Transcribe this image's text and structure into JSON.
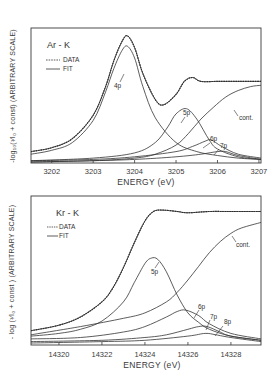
{
  "chart_data": [
    {
      "type": "line",
      "title": "Ar - K",
      "xlabel": "ENERGY (eV)",
      "ylabel": "-log10(I/I0 + const) (ARBITRARY SCALE)",
      "ylabel_text": "-log₁₀(¹⁄I₀ + const) (ARBITRARY SCALE)",
      "xlim": [
        3201.5,
        3207.05
      ],
      "xticks": [
        3202,
        3203,
        3204,
        3205,
        3206,
        3207
      ],
      "xtick_labels": [
        "3202",
        "3203",
        "3204",
        "3205",
        "3206",
        "3207"
      ],
      "grid": false,
      "legend": {
        "position": "upper left",
        "entries": [
          {
            "label": "DATA",
            "style": "dashed"
          },
          {
            "label": "FIT",
            "style": "solid"
          }
        ]
      },
      "annotations": [
        "4p",
        "5p",
        "6p",
        "7p",
        "cont."
      ],
      "series": [
        {
          "name": "DATA",
          "x": [
            3201.5,
            3202,
            3202.5,
            3203,
            3203.3,
            3203.5,
            3203.7,
            3203.83,
            3204,
            3204.2,
            3204.5,
            3204.7,
            3205,
            3205.2,
            3205.4,
            3205.6,
            3206,
            3206.5,
            3207.05
          ],
          "y": [
            0.08,
            0.11,
            0.18,
            0.36,
            0.58,
            0.78,
            0.93,
            0.97,
            0.88,
            0.68,
            0.48,
            0.44,
            0.52,
            0.62,
            0.65,
            0.62,
            0.62,
            0.62,
            0.62
          ]
        },
        {
          "name": "FIT",
          "x": [
            3201.5,
            3202,
            3202.5,
            3203,
            3203.3,
            3203.5,
            3203.7,
            3203.83,
            3204,
            3204.2,
            3204.5,
            3204.7,
            3205,
            3205.2,
            3205.4,
            3205.6,
            3206,
            3206.5,
            3207.05
          ],
          "y": [
            0.08,
            0.11,
            0.18,
            0.36,
            0.58,
            0.78,
            0.93,
            0.97,
            0.88,
            0.68,
            0.48,
            0.44,
            0.52,
            0.62,
            0.65,
            0.62,
            0.62,
            0.62,
            0.62
          ]
        },
        {
          "name": "4p",
          "x": [
            3201.5,
            3202,
            3202.5,
            3203,
            3203.3,
            3203.5,
            3203.7,
            3203.83,
            3204,
            3204.2,
            3204.5,
            3205,
            3205.5,
            3206,
            3206.5,
            3207.05
          ],
          "y": [
            0.06,
            0.09,
            0.15,
            0.32,
            0.54,
            0.72,
            0.86,
            0.89,
            0.8,
            0.58,
            0.34,
            0.15,
            0.08,
            0.05,
            0.03,
            0.02
          ]
        },
        {
          "name": "5p",
          "x": [
            3201.5,
            3203,
            3204,
            3204.5,
            3204.8,
            3205,
            3205.25,
            3205.5,
            3205.8,
            3206,
            3206.5,
            3207.05
          ],
          "y": [
            0.01,
            0.03,
            0.07,
            0.15,
            0.27,
            0.37,
            0.41,
            0.33,
            0.17,
            0.1,
            0.04,
            0.02
          ]
        },
        {
          "name": "6p",
          "x": [
            3201.5,
            3203,
            3204,
            3205,
            3205.4,
            3205.7,
            3205.85,
            3206.1,
            3206.5,
            3207.05
          ],
          "y": [
            0.01,
            0.02,
            0.04,
            0.08,
            0.12,
            0.16,
            0.17,
            0.12,
            0.06,
            0.03
          ]
        },
        {
          "name": "7p",
          "x": [
            3201.5,
            3203,
            3204,
            3205,
            3205.6,
            3206,
            3206.2,
            3206.5,
            3207.05
          ],
          "y": [
            0.0,
            0.01,
            0.02,
            0.04,
            0.06,
            0.08,
            0.08,
            0.05,
            0.02
          ]
        },
        {
          "name": "cont.",
          "x": [
            3201.5,
            3203,
            3204,
            3204.5,
            3205,
            3205.3,
            3205.6,
            3205.9,
            3206.2,
            3206.5,
            3206.8,
            3207.05
          ],
          "y": [
            0.0,
            0.01,
            0.03,
            0.06,
            0.13,
            0.22,
            0.33,
            0.42,
            0.5,
            0.55,
            0.58,
            0.59
          ]
        }
      ]
    },
    {
      "type": "line",
      "title": "Kr - K",
      "xlabel": "ENERGY (eV)",
      "ylabel": "-log (I/I0 + const) (ARBITRARY SCALE)",
      "ylabel_text": "- log (¹⁄I₀ + const ) (ARBITRARY SCALE)",
      "xlim": [
        14318.7,
        14329.4
      ],
      "xticks": [
        14320,
        14322,
        14324,
        14326,
        14328
      ],
      "xtick_labels": [
        "14320",
        "14322",
        "14324",
        "14326",
        "14328"
      ],
      "grid": false,
      "legend": {
        "position": "upper left",
        "entries": [
          {
            "label": "DATA",
            "style": "dashed"
          },
          {
            "label": "FIT",
            "style": "solid"
          }
        ]
      },
      "annotations": [
        "5p",
        "6p",
        "7p",
        "8p",
        "cont."
      ],
      "series": [
        {
          "name": "DATA",
          "x": [
            14318.7,
            14320,
            14321,
            14322,
            14322.5,
            14323,
            14323.5,
            14324,
            14324.4,
            14324.8,
            14325.5,
            14326,
            14327,
            14328,
            14329.4
          ],
          "y": [
            0.09,
            0.13,
            0.19,
            0.3,
            0.4,
            0.55,
            0.73,
            0.89,
            0.96,
            0.97,
            0.96,
            0.95,
            0.96,
            0.96,
            0.96
          ]
        },
        {
          "name": "FIT",
          "x": [
            14318.7,
            14320,
            14321,
            14322,
            14322.5,
            14323,
            14323.5,
            14324,
            14324.4,
            14324.8,
            14325.5,
            14326,
            14327,
            14328,
            14329.4
          ],
          "y": [
            0.09,
            0.13,
            0.19,
            0.3,
            0.4,
            0.55,
            0.73,
            0.89,
            0.96,
            0.97,
            0.96,
            0.95,
            0.96,
            0.96,
            0.96
          ]
        },
        {
          "name": "5p",
          "x": [
            14318.7,
            14320,
            14321,
            14322,
            14323,
            14323.5,
            14324,
            14324.3,
            14324.6,
            14325,
            14325.5,
            14326,
            14326.5,
            14327,
            14328,
            14329.4
          ],
          "y": [
            0.05,
            0.07,
            0.1,
            0.16,
            0.3,
            0.44,
            0.58,
            0.62,
            0.61,
            0.52,
            0.35,
            0.22,
            0.15,
            0.1,
            0.05,
            0.02
          ]
        },
        {
          "name": "6p",
          "x": [
            14318.7,
            14321,
            14323,
            14324,
            14325,
            14325.5,
            14325.9,
            14326.5,
            14327,
            14328,
            14329.4
          ],
          "y": [
            0.03,
            0.04,
            0.08,
            0.12,
            0.19,
            0.23,
            0.24,
            0.2,
            0.14,
            0.07,
            0.03
          ]
        },
        {
          "name": "7p",
          "x": [
            14318.7,
            14322,
            14324,
            14325,
            14326,
            14326.5,
            14326.9,
            14327.5,
            14328,
            14329.4
          ],
          "y": [
            0.01,
            0.02,
            0.04,
            0.06,
            0.1,
            0.12,
            0.12,
            0.08,
            0.05,
            0.02
          ]
        },
        {
          "name": "8p",
          "x": [
            14318.7,
            14322,
            14324,
            14326,
            14326.8,
            14327.3,
            14328,
            14329.4
          ],
          "y": [
            0.0,
            0.01,
            0.02,
            0.05,
            0.07,
            0.06,
            0.04,
            0.01
          ]
        },
        {
          "name": "cont.",
          "x": [
            14318.7,
            14321,
            14323,
            14324,
            14325,
            14325.5,
            14326,
            14326.5,
            14327,
            14327.5,
            14328,
            14328.5,
            14329.4
          ],
          "y": [
            0.06,
            0.12,
            0.18,
            0.22,
            0.3,
            0.37,
            0.46,
            0.56,
            0.66,
            0.74,
            0.8,
            0.84,
            0.88
          ]
        }
      ]
    }
  ],
  "panels": [
    {
      "title": "Ar - K",
      "legend_data": "DATA",
      "legend_fit": "FIT",
      "xlabel": "ENERGY (eV)",
      "ylabel": "-log₁₀(¹⁄I₀ + const) (ARBITRARY SCALE)",
      "xtick_labels": [
        "3202",
        "3203",
        "3204",
        "3205",
        "3206",
        "3207"
      ],
      "labels": {
        "p4": "4p",
        "p5": "5p",
        "p6": "6p",
        "p7": "7p",
        "cont": "cont."
      }
    },
    {
      "title": "Kr - K",
      "legend_data": "DATA",
      "legend_fit": "FIT",
      "xlabel": "ENERGY (eV)",
      "ylabel": "- log (¹⁄I₀ + const ) (ARBITRARY SCALE)",
      "xtick_labels": [
        "14320",
        "14322",
        "14324",
        "14326",
        "14328"
      ],
      "labels": {
        "p5": "5p",
        "p6": "6p",
        "p7": "7p",
        "p8": "8p",
        "cont": "cont."
      }
    }
  ],
  "colors": {
    "ink": "#333333",
    "background": "#ffffff"
  }
}
